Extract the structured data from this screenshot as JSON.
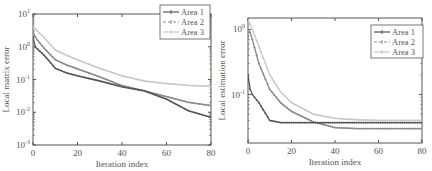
{
  "chart_data": [
    {
      "type": "line",
      "title": "",
      "xlabel": "Iteration index",
      "ylabel": "Local matrix error",
      "yscale": "log",
      "xlim": [
        0,
        80
      ],
      "ylim": [
        0.001,
        10
      ],
      "xticks": [
        0,
        20,
        40,
        60,
        80
      ],
      "yticks": [
        "10^-3",
        "10^-2",
        "10^-1",
        "10^0",
        "10^1"
      ],
      "grid": false,
      "legend_position": "upper right",
      "x": [
        0,
        1,
        2,
        5,
        10,
        15,
        20,
        30,
        40,
        50,
        60,
        70,
        80
      ],
      "series": [
        {
          "name": "Area 1",
          "color": "#555555",
          "marker": "+",
          "values": [
            2.0,
            1.0,
            0.85,
            0.55,
            0.22,
            0.16,
            0.13,
            0.09,
            0.06,
            0.045,
            0.025,
            0.011,
            0.007
          ]
        },
        {
          "name": "Area 2",
          "color": "#888888",
          "marker": "x",
          "values": [
            3.0,
            2.0,
            1.6,
            0.9,
            0.4,
            0.28,
            0.21,
            0.12,
            0.065,
            0.045,
            0.03,
            0.02,
            0.016
          ]
        },
        {
          "name": "Area 3",
          "color": "#c8c8c8",
          "marker": "*",
          "values": [
            4.0,
            3.5,
            3.0,
            1.9,
            0.8,
            0.55,
            0.4,
            0.22,
            0.13,
            0.09,
            0.075,
            0.066,
            0.062
          ]
        }
      ]
    },
    {
      "type": "line",
      "title": "",
      "xlabel": "Iteration index",
      "ylabel": "Local estimation error",
      "yscale": "log",
      "xlim": [
        0,
        80
      ],
      "ylim": [
        0.018,
        1.5
      ],
      "xticks": [
        0,
        20,
        40,
        60,
        80
      ],
      "yticks": [
        "10^-1",
        "10^0"
      ],
      "grid": false,
      "legend_position": "upper right",
      "x": [
        0,
        1,
        2,
        5,
        10,
        15,
        20,
        30,
        40,
        50,
        60,
        70,
        80
      ],
      "series": [
        {
          "name": "Area 1",
          "color": "#555555",
          "marker": "+",
          "values": [
            0.2,
            0.12,
            0.1,
            0.075,
            0.04,
            0.037,
            0.037,
            0.037,
            0.037,
            0.037,
            0.037,
            0.037,
            0.037
          ]
        },
        {
          "name": "Area 2",
          "color": "#888888",
          "marker": "x",
          "values": [
            1.0,
            0.9,
            0.7,
            0.3,
            0.12,
            0.075,
            0.055,
            0.038,
            0.031,
            0.03,
            0.03,
            0.03,
            0.03
          ]
        },
        {
          "name": "Area 3",
          "color": "#c8c8c8",
          "marker": "*",
          "values": [
            1.4,
            1.2,
            1.0,
            0.55,
            0.2,
            0.11,
            0.075,
            0.05,
            0.043,
            0.041,
            0.04,
            0.04,
            0.04
          ]
        }
      ]
    }
  ]
}
